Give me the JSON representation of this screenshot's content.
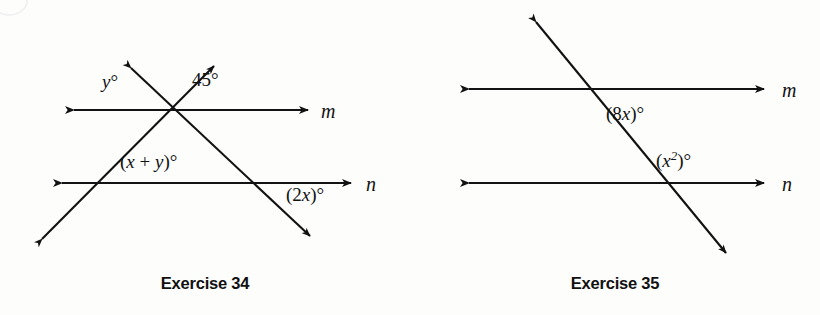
{
  "page": {
    "width": 820,
    "height": 315,
    "background": "#fdfdfc",
    "ink_color": "#121212"
  },
  "figures": [
    {
      "id": "exercise-34",
      "caption": "Exercise 34",
      "description": "Two parallel lines m and n cut by two transversals forming a triangle",
      "lines": [
        {
          "name": "m",
          "label": "m",
          "label_x": 325,
          "label_y": 113,
          "x1": 70,
          "y1": 110,
          "x2": 312,
          "y2": 110,
          "arrows": "both"
        },
        {
          "name": "n",
          "label": "n",
          "label_x": 369,
          "label_y": 186,
          "x1": 58,
          "y1": 183,
          "x2": 355,
          "y2": 183,
          "arrows": "both"
        },
        {
          "name": "transversal-rising",
          "x1": 38,
          "y1": 243,
          "x2": 218,
          "y2": 62,
          "arrows": "both"
        },
        {
          "name": "transversal-falling",
          "x1": 127,
          "y1": 64,
          "x2": 314,
          "y2": 240,
          "arrows": "both"
        }
      ],
      "angle_labels": [
        {
          "id": "angle-y",
          "text": "y°",
          "x": 106,
          "y": 82,
          "italic_prefix": "y",
          "suffix": "°"
        },
        {
          "id": "angle-45",
          "text": "45°",
          "x": 196,
          "y": 80
        },
        {
          "id": "angle-x-plus-y",
          "text": "(x + y)°",
          "x": 122,
          "y": 161
        },
        {
          "id": "angle-2x",
          "text": "(2x)°",
          "x": 288,
          "y": 193
        }
      ]
    },
    {
      "id": "exercise-35",
      "caption": "Exercise 35",
      "description": "Two parallel lines m and n cut by one transversal",
      "lines": [
        {
          "name": "m",
          "label": "m",
          "label_x": 375,
          "label_y": 92,
          "x1": 55,
          "y1": 89,
          "x2": 358,
          "y2": 89,
          "arrows": "both"
        },
        {
          "name": "n",
          "label": "n",
          "label_x": 375,
          "label_y": 186,
          "x1": 55,
          "y1": 183,
          "x2": 358,
          "y2": 183,
          "arrows": "both"
        },
        {
          "name": "transversal",
          "x1": 123,
          "y1": 18,
          "x2": 320,
          "y2": 257,
          "arrows": "both"
        }
      ],
      "angle_labels": [
        {
          "id": "angle-8x",
          "text": "(8x)°",
          "x": 198,
          "y": 113
        },
        {
          "id": "angle-x-squared",
          "text": "(x2)°",
          "x": 248,
          "y": 159
        }
      ]
    }
  ],
  "angle_text": {
    "y_deg": "y°",
    "forty_five_deg": "45°",
    "x_plus_y_deg": "(x + y)°",
    "two_x_deg": "(2x)°",
    "eight_x_deg": "(8x)°",
    "x_squared_deg": "(x²)°"
  },
  "line_names": {
    "m": "m",
    "n": "n"
  },
  "captions": {
    "left": "Exercise 34",
    "right": "Exercise 35"
  }
}
